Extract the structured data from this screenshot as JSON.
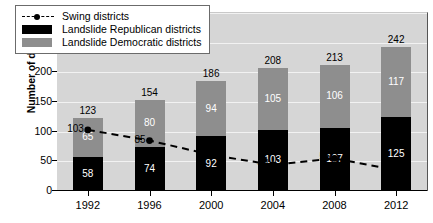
{
  "chart": {
    "type": "bar",
    "title": "",
    "xlabel": "",
    "ylabel": "Number of districts"
  },
  "legend": {
    "items": [
      {
        "label": "Swing districts",
        "key": "dashed-line-marker",
        "color": "#000000"
      },
      {
        "label": "Landslide Republican districts",
        "key": "swatch",
        "color": "#000000"
      },
      {
        "label": "Landslide Democratic districts",
        "key": "swatch",
        "color": "#8e8e8e"
      }
    ]
  },
  "y_axis": {
    "ticks": [
      {
        "value": 0,
        "label": "0"
      },
      {
        "value": 50,
        "label": "50"
      },
      {
        "value": 100,
        "label": "100"
      },
      {
        "value": 150,
        "label": "150"
      },
      {
        "value": 200,
        "label": "200"
      },
      {
        "value": 250,
        "label": "250"
      },
      {
        "value": 300,
        "label": ""
      }
    ],
    "min": 0,
    "max": 300
  },
  "x_axis": {
    "ticks": [
      "1992",
      "1996",
      "2000",
      "2004",
      "2008",
      "2012"
    ]
  },
  "chart_data": {
    "type": "bar",
    "title": "",
    "xlabel": "",
    "ylabel": "Number of districts",
    "ylim": [
      0,
      300
    ],
    "grid": true,
    "legend_position": "top-left",
    "categories": [
      "1992",
      "1996",
      "2000",
      "2004",
      "2008",
      "2012"
    ],
    "stacked": true,
    "series": [
      {
        "name": "Landslide Republican districts",
        "type": "bar",
        "color": "#000000",
        "values": [
          58,
          74,
          92,
          103,
          107,
          125
        ]
      },
      {
        "name": "Landslide Democratic districts",
        "type": "bar",
        "color": "#8e8e8e",
        "values": [
          65,
          80,
          94,
          105,
          106,
          117
        ]
      },
      {
        "name": "Swing districts",
        "type": "line",
        "color": "#000000",
        "style": "dashed",
        "marker": "circle",
        "values": [
          103,
          85,
          61,
          44,
          55,
          35
        ]
      }
    ],
    "bar_totals": [
      123,
      154,
      186,
      208,
      213,
      242
    ],
    "annotations": {
      "total_labels": [
        "123",
        "154",
        "186",
        "208",
        "213",
        "242"
      ],
      "republican_labels": [
        "58",
        "74",
        "92",
        "103",
        "107",
        "125"
      ],
      "democratic_labels": [
        "65",
        "80",
        "94",
        "105",
        "106",
        "117"
      ],
      "swing_labels": [
        "103",
        "85",
        "61",
        "44",
        "55",
        "35"
      ]
    }
  }
}
